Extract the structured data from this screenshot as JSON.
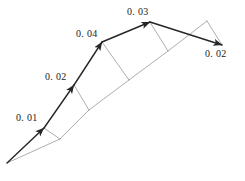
{
  "figure": {
    "type": "vector-diagram",
    "background_color": "#ffffff",
    "width": 245,
    "height": 181,
    "main_stroke_color": "#262626",
    "aux_stroke_color": "#8a8a8a",
    "main_stroke_width": 1.4,
    "aux_stroke_width": 0.7
  },
  "labels": [
    {
      "id": "label-001",
      "text": "0. 01",
      "x": 16,
      "y": 113
    },
    {
      "id": "label-002",
      "text": "0. 02",
      "x": 45,
      "y": 72
    },
    {
      "id": "label-004",
      "text": "0. 04",
      "x": 76,
      "y": 29
    },
    {
      "id": "label-003",
      "text": "0. 03",
      "x": 127,
      "y": 7
    },
    {
      "id": "label-002b",
      "text": "0. 02",
      "x": 205,
      "y": 49
    }
  ],
  "geometry": {
    "origin": {
      "x": 7,
      "y": 163
    },
    "vertices": [
      {
        "name": "v1",
        "x": 44,
        "y": 128
      },
      {
        "name": "v2",
        "x": 74,
        "y": 85
      },
      {
        "name": "v3",
        "x": 102,
        "y": 42
      },
      {
        "name": "v4",
        "x": 150,
        "y": 22
      },
      {
        "name": "v5",
        "x": 222,
        "y": 45
      }
    ],
    "baseline_points": [
      {
        "name": "b1",
        "x": 60,
        "y": 139
      },
      {
        "name": "b2",
        "x": 89,
        "y": 110
      },
      {
        "name": "b3",
        "x": 129,
        "y": 80
      },
      {
        "name": "b4",
        "x": 168,
        "y": 51
      },
      {
        "name": "b5",
        "x": 207,
        "y": 21
      }
    ],
    "main_chain": [
      {
        "from": "origin",
        "to": "v1",
        "arrow": true
      },
      {
        "from": "v1",
        "to": "v2",
        "arrow": true
      },
      {
        "from": "v2",
        "to": "v3",
        "arrow": true
      },
      {
        "from": "v3",
        "to": "v4",
        "arrow": true
      },
      {
        "from": "v4",
        "to": "v5",
        "arrow": true
      }
    ],
    "aux_chain": [
      {
        "from": "origin",
        "to": "b1"
      },
      {
        "from": "b1",
        "to": "b2"
      },
      {
        "from": "b2",
        "to": "b3"
      },
      {
        "from": "b3",
        "to": "b4"
      },
      {
        "from": "b4",
        "to": "b5"
      }
    ],
    "aux_connectors": [
      {
        "from": "v1",
        "to": "b1"
      },
      {
        "from": "v2",
        "to": "b2"
      },
      {
        "from": "v3",
        "to": "b3"
      },
      {
        "from": "v4",
        "to": "b4"
      },
      {
        "from": "b5",
        "to": "v5"
      }
    ]
  }
}
